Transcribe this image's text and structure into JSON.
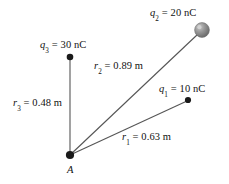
{
  "figure": {
    "background_color": "#ffffff",
    "line_color": "#555555",
    "dot_color": "#1a1a1a",
    "sphere_color": "#8c8c8c",
    "width": 229,
    "height": 184
  },
  "vertex": {
    "name": "A",
    "label": "A",
    "x": 70,
    "y": 155
  },
  "charges": [
    {
      "id": "q1",
      "label_q": "q",
      "label_sub": "1",
      "label_value": " = 10 nC",
      "label_full": "q1 = 10 nC",
      "marker": "dot",
      "x": 188,
      "y": 100,
      "label_x": 159,
      "label_y": 84
    },
    {
      "id": "q2",
      "label_q": "q",
      "label_sub": "2",
      "label_value": " = 20 nC",
      "label_full": "q2 = 20 nC",
      "marker": "sphere",
      "x": 202,
      "y": 30,
      "label_x": 150,
      "label_y": 8
    },
    {
      "id": "q3",
      "label_q": "q",
      "label_sub": "3",
      "label_value": " = 30 nC",
      "label_full": "q3 = 30 nC",
      "marker": "dot",
      "x": 70,
      "y": 57,
      "label_x": 40,
      "label_y": 40
    }
  ],
  "distances": [
    {
      "id": "r1",
      "label_r": "r",
      "label_sub": "1",
      "label_value": " = 0.63 m",
      "label_full": "r1 = 0.63 m",
      "from": "A",
      "to": "q1",
      "label_x": 122,
      "label_y": 132
    },
    {
      "id": "r2",
      "label_r": "r",
      "label_sub": "2",
      "label_value": " = 0.89 m",
      "label_full": "r2 = 0.89 m",
      "from": "A",
      "to": "q2",
      "label_x": 94,
      "label_y": 61
    },
    {
      "id": "r3",
      "label_r": "r",
      "label_sub": "3",
      "label_value": " = 0.48 m",
      "label_full": "r3 = 0.48 m",
      "from": "A",
      "to": "q3",
      "label_x": 13,
      "label_y": 98
    }
  ]
}
